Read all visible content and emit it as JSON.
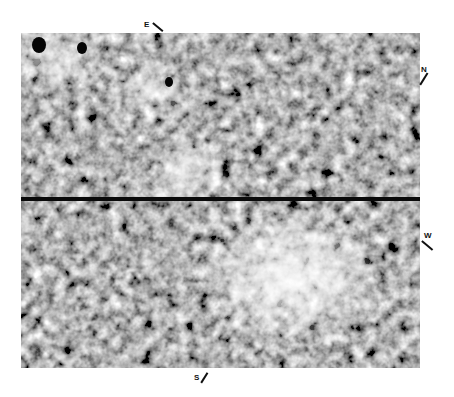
{
  "figure": {
    "compass": {
      "east": "E",
      "north": "N",
      "west": "W",
      "south": "S"
    },
    "colors": {
      "background": "#ffffff",
      "dark_tone": "#2a2a2a",
      "light_tone": "#f2f2f2",
      "reference_line": "#0a0a0a"
    }
  }
}
